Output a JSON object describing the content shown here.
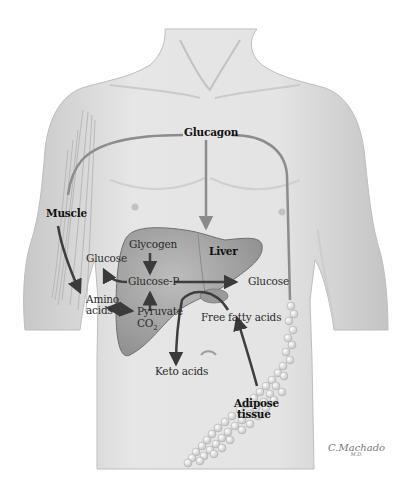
{
  "diagram": {
    "background": "#ffffff",
    "body_fill": "#dcdcdc",
    "liver_fill": "#a9a9a9",
    "arrow_color": "#444444",
    "hormone_line_color": "#8c8c8c",
    "labels": {
      "glucagon": "Glucagon",
      "muscle": "Muscle",
      "liver": "Liver",
      "glycogen": "Glycogen",
      "glucose_left": "Glucose",
      "glucose_p": "Glucose-P",
      "glucose_right": "Glucose",
      "amino": "Amino",
      "acids": "acids",
      "pyruvate": "Pyruvate",
      "co2": "CO",
      "co2_sub": "2",
      "free_fatty_acids": "Free fatty acids",
      "keto_acids": "Keto acids",
      "adipose": "Adipose",
      "tissue": "tissue"
    },
    "signature": {
      "name": "C.Machado",
      "suffix": "M.D."
    }
  }
}
